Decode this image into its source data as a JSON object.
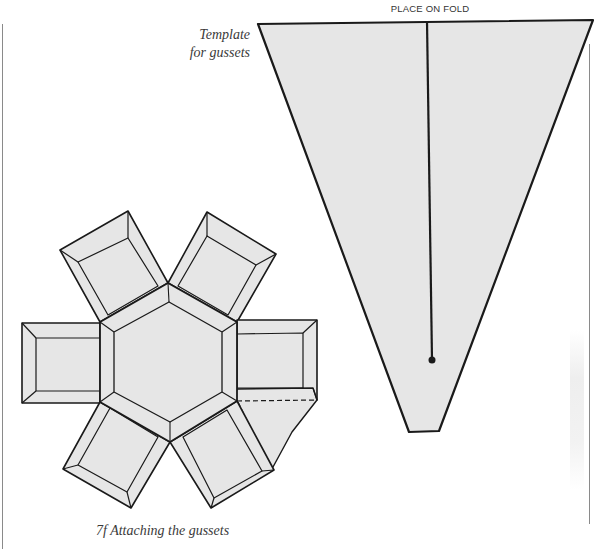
{
  "page": {
    "background": "#ffffff",
    "fill_color": "#e6e6e6",
    "stroke_color": "#1a1a1a"
  },
  "template": {
    "caption_line1": "Template",
    "caption_line2": "for gussets",
    "fold_label": "PLACE ON FOLD",
    "shape": "trapezoid",
    "fold_line": "vertical centre line with end dot"
  },
  "net": {
    "center_shape": "hexagon",
    "flaps": 6,
    "gusset_attached": "lower-right, between right and lower-right flaps",
    "gusset_fold_lines": "dashed"
  },
  "figure": {
    "caption": "7f Attaching the gussets"
  }
}
